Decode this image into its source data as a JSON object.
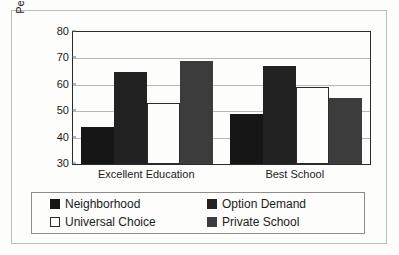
{
  "chart_data": {
    "type": "bar",
    "title": "",
    "xlabel": "",
    "ylabel": "Percent Satisfied",
    "categories": [
      "Excellent Education",
      "Best School"
    ],
    "series": [
      {
        "name": "Neighborhood",
        "color": "#161616",
        "values": [
          44,
          49
        ]
      },
      {
        "name": "Option Demand",
        "color": "#222222",
        "values": [
          65,
          67
        ]
      },
      {
        "name": "Universal Choice",
        "color": "#ffffff",
        "values": [
          53,
          59
        ]
      },
      {
        "name": "Private School",
        "color": "#3c3c3c",
        "values": [
          69,
          55
        ]
      }
    ],
    "ylim": [
      30,
      80
    ],
    "yticks": [
      30,
      40,
      50,
      60,
      70,
      80
    ],
    "ytick_labels": [
      "30",
      "40",
      "50",
      "60",
      "70",
      "80"
    ],
    "grid": true,
    "legend_position": "bottom"
  },
  "axis": {
    "y_title": "Percent Satisfied",
    "ticks": [
      "80",
      "70",
      "60",
      "50",
      "40",
      "30"
    ]
  },
  "x_labels": [
    "Excellent Education",
    "Best School"
  ],
  "legend": {
    "items": [
      {
        "label": "Neighborhood"
      },
      {
        "label": "Option Demand"
      },
      {
        "label": "Universal Choice"
      },
      {
        "label": "Private School"
      }
    ]
  }
}
